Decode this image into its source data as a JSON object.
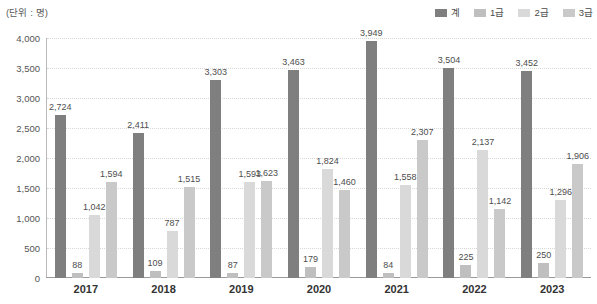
{
  "unit_label": "(단위 : 명)",
  "legend": {
    "position": "top-right",
    "items": [
      {
        "label": "계",
        "color": "#7f7f7f"
      },
      {
        "label": "1급",
        "color": "#bfbfbf"
      },
      {
        "label": "2급",
        "color": "#d9d9d9"
      },
      {
        "label": "3급",
        "color": "#c9c9c9"
      }
    ]
  },
  "axis": {
    "y_ticks": [
      "0",
      "500",
      "1,000",
      "1,500",
      "2,000",
      "2,500",
      "3,000",
      "3,500",
      "4,000"
    ],
    "x_ticks": [
      "2017",
      "2018",
      "2019",
      "2020",
      "2021",
      "2022",
      "2023"
    ]
  },
  "chart_data": {
    "type": "bar",
    "title": "",
    "xlabel": "",
    "ylabel": "",
    "unit": "명",
    "grid": true,
    "legend_position": "top-right",
    "ylim": [
      0,
      4000
    ],
    "ytick_step": 500,
    "categories": [
      "2017",
      "2018",
      "2019",
      "2020",
      "2021",
      "2022",
      "2023"
    ],
    "series": [
      {
        "name": "계",
        "color": "#7f7f7f",
        "values": [
          2724,
          2411,
          3303,
          3463,
          3949,
          3504,
          3452
        ],
        "labels": [
          "2,724",
          "2,411",
          "3,303",
          "3,463",
          "3,949",
          "3,504",
          "3,452"
        ]
      },
      {
        "name": "1급",
        "color": "#bfbfbf",
        "values": [
          88,
          109,
          87,
          179,
          84,
          225,
          250
        ],
        "labels": [
          "88",
          "109",
          "87",
          "179",
          "84",
          "225",
          "250"
        ]
      },
      {
        "name": "2급",
        "color": "#d9d9d9",
        "values": [
          1042,
          787,
          1593,
          1824,
          1558,
          2137,
          1296
        ],
        "labels": [
          "1,042",
          "787",
          "1,593",
          "1,824",
          "1,558",
          "2,137",
          "1,296"
        ]
      },
      {
        "name": "3급",
        "color": "#c9c9c9",
        "values": [
          1594,
          1515,
          1623,
          1460,
          2307,
          1142,
          1906
        ],
        "labels": [
          "1,594",
          "1,515",
          "1,623",
          "1,460",
          "2,307",
          "1,142",
          "1,906"
        ]
      }
    ]
  }
}
